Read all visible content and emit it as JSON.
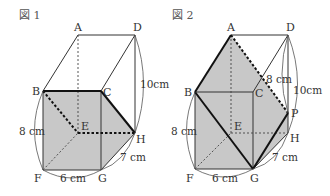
{
  "figures": [
    {
      "title": "図 1",
      "vertices": {
        "A": "A",
        "B": "B",
        "C": "C",
        "D": "D",
        "E": "E",
        "F": "F",
        "G": "G",
        "H": "H"
      },
      "dimensions": {
        "height": "10cm",
        "side": "8 cm",
        "width": "6 cm",
        "depth": "7 cm"
      }
    },
    {
      "title": "図 2",
      "vertices": {
        "A": "A",
        "B": "B",
        "C": "C",
        "D": "D",
        "E": "E",
        "F": "F",
        "G": "G",
        "H": "H",
        "P": "P"
      },
      "dimensions": {
        "dp": "8 cm",
        "height": "10cm",
        "side": "8 cm",
        "width": "6 cm",
        "depth": "7 cm"
      }
    }
  ],
  "colors": {
    "shade": "#c8c8c8",
    "line": "#333333",
    "bold": "#111111"
  }
}
